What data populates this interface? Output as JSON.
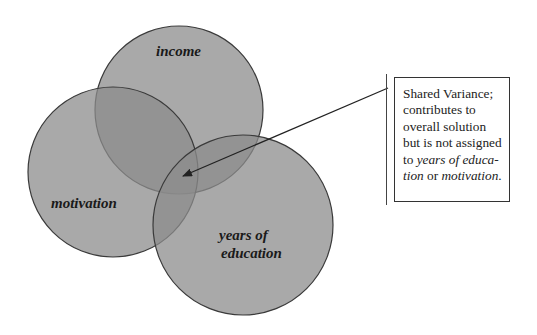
{
  "diagram": {
    "type": "venn",
    "circles": [
      {
        "id": "income",
        "label_lines": [
          "income"
        ],
        "cx": 179,
        "cy": 110,
        "r": 84
      },
      {
        "id": "motivation",
        "label_lines": [
          "motivation"
        ],
        "cx": 113,
        "cy": 172,
        "r": 85
      },
      {
        "id": "years_of_education",
        "label_lines": [
          "years of",
          "education"
        ],
        "cx": 243,
        "cy": 225,
        "r": 90
      }
    ],
    "colors": {
      "circle_fill": "#8c8c8c",
      "circle_fill_opacity": 0.75,
      "circle_stroke": "#3a3a3a",
      "arrow": "#222222",
      "background": "#ffffff"
    },
    "arrow": {
      "from": [
        388,
        88
      ],
      "to": [
        183,
        176
      ]
    },
    "callout": {
      "lines": [
        {
          "parts": [
            {
              "text": "Shared Variance;",
              "italic": false
            }
          ]
        },
        {
          "parts": [
            {
              "text": "contributes to",
              "italic": false
            }
          ]
        },
        {
          "parts": [
            {
              "text": "overall solution",
              "italic": false
            }
          ]
        },
        {
          "parts": [
            {
              "text": "but is not assigned",
              "italic": false
            }
          ]
        },
        {
          "parts": [
            {
              "text": "to ",
              "italic": false
            },
            {
              "text": "years of educa-",
              "italic": true
            }
          ]
        },
        {
          "parts": [
            {
              "text": "tion",
              "italic": true
            },
            {
              "text": " or ",
              "italic": false
            },
            {
              "text": "motivation",
              "italic": true
            },
            {
              "text": ".",
              "italic": false
            }
          ]
        }
      ]
    }
  }
}
